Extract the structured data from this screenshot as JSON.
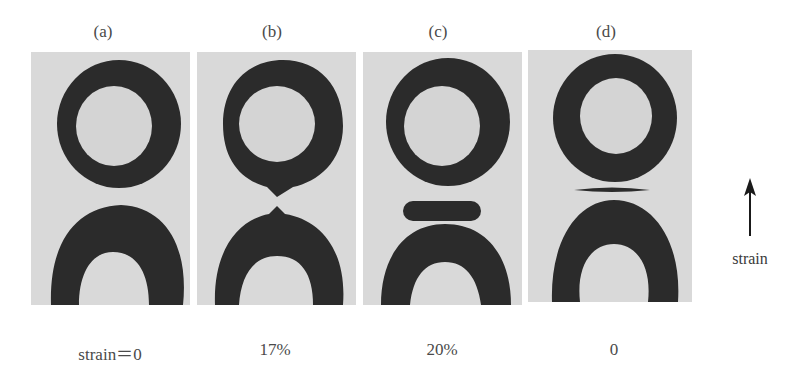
{
  "figure": {
    "panels": [
      {
        "id": "a",
        "label": "(a)",
        "caption": "strain＝0",
        "gap_feature": "none"
      },
      {
        "id": "b",
        "label": "(b)",
        "caption": "17%",
        "gap_feature": "necking-cusps"
      },
      {
        "id": "c",
        "label": "(c)",
        "caption": "20%",
        "gap_feature": "detached-droplet"
      },
      {
        "id": "d",
        "label": "(d)",
        "caption": "0",
        "gap_feature": "thin-film"
      }
    ],
    "arrow": {
      "icon": "up-arrow-icon",
      "label": "strain"
    },
    "colors": {
      "panel_background": "#d9d9d9",
      "dark_phase": "#2b2b2b",
      "light_core": "#d4d4d4"
    }
  }
}
